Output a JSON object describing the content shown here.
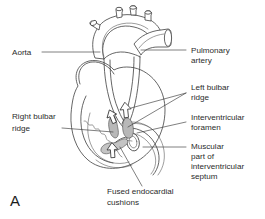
{
  "figure": {
    "panel_letter": "A",
    "background_color": "#ffffff",
    "line_color": "#3f3f3f",
    "text_color": "#2b2b2b",
    "shade_color": "#b8b8b8"
  },
  "labels": {
    "aorta": {
      "lines": [
        "Aorta"
      ],
      "side": "left"
    },
    "pulmonary_artery": {
      "lines": [
        "Pulmonary",
        "artery"
      ],
      "side": "right"
    },
    "left_bulbar_ridge": {
      "lines": [
        "Left bulbar",
        "ridge"
      ],
      "side": "right"
    },
    "interventricular_foramen": {
      "lines": [
        "Interventricular",
        "foramen"
      ],
      "side": "right"
    },
    "muscular_part": {
      "lines": [
        "Muscular",
        "part of",
        "interventricular",
        "septum"
      ],
      "side": "right"
    },
    "right_bulbar_ridge": {
      "lines": [
        "Right bulbar",
        "ridge"
      ],
      "side": "left"
    },
    "fused_endocardial_cushions": {
      "lines": [
        "Fused endocardial",
        "cushions"
      ],
      "side": "bottom"
    }
  },
  "icons": {
    "blood_flow_arrow": "up-arrow-icon"
  }
}
